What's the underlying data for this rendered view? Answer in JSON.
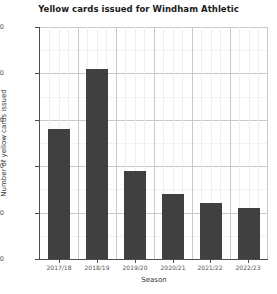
{
  "chart_data": {
    "type": "bar",
    "title": "Yellow cards issued for Windham Athletic",
    "xlabel": "Season",
    "ylabel": "Number of yellow cards issued",
    "categories": [
      "2017/18",
      "2018/19",
      "2019/20",
      "2020/21",
      "2021/22",
      "2022/23"
    ],
    "values": [
      58,
      71,
      49,
      44,
      42,
      41
    ],
    "ylim": [
      30,
      80
    ],
    "yticks": [
      30,
      40,
      50,
      60,
      70,
      80
    ],
    "ytick_labels": [
      "30",
      "40",
      "50",
      "60",
      "70",
      "80"
    ],
    "grid": true,
    "legend": false,
    "bar_color": "#404040",
    "grid_color": "#c9c9c9",
    "background": "#ffffff"
  }
}
